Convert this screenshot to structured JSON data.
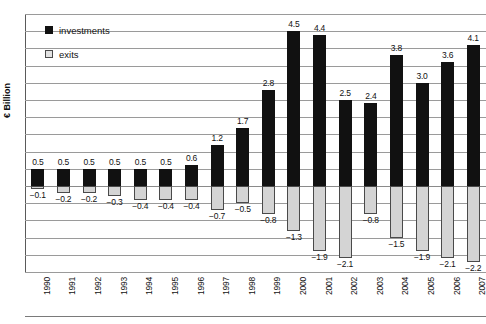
{
  "chart_data": {
    "type": "bar",
    "title": "",
    "xlabel": "",
    "ylabel": "€ Billion",
    "ylim": [
      -2.5,
      5.0
    ],
    "grid": true,
    "legend_position": "top-left-inside",
    "categories": [
      "1990",
      "1991",
      "1992",
      "1993",
      "1994",
      "1995",
      "1996",
      "1997",
      "1998",
      "1999",
      "2000",
      "2001",
      "2002",
      "2003",
      "2004",
      "2005",
      "2006",
      "2007"
    ],
    "series": [
      {
        "name": "investments",
        "color": "#111111",
        "values": [
          0.5,
          0.5,
          0.5,
          0.5,
          0.5,
          0.5,
          0.6,
          1.2,
          1.7,
          2.8,
          4.5,
          4.4,
          2.5,
          2.4,
          3.8,
          3.0,
          3.6,
          4.1
        ],
        "labels": [
          "0.5",
          "0.5",
          "0.5",
          "0.5",
          "0.5",
          "0.5",
          "0.6",
          "1.2",
          "1.7",
          "2.8",
          "4.5",
          "4.4",
          "2.5",
          "2.4",
          "3.8",
          "3.0",
          "3.6",
          "4.1"
        ]
      },
      {
        "name": "exits",
        "color": "#d4d4d4",
        "values": [
          -0.1,
          -0.2,
          -0.2,
          -0.3,
          -0.4,
          -0.4,
          -0.4,
          -0.7,
          -0.5,
          -0.8,
          -1.3,
          -1.9,
          -2.1,
          -0.8,
          -1.5,
          -1.9,
          -2.1,
          -2.2
        ],
        "labels": [
          "−0.1",
          "−0.2",
          "−0.2",
          "−0.3",
          "−0.4",
          "−0.4",
          "−0.4",
          "−0.7",
          "−0.5",
          "−0.8",
          "−1.3",
          "−1.9",
          "−2.1",
          "−0.8",
          "−1.5",
          "−1.9",
          "−2.1",
          "−2.2"
        ]
      }
    ],
    "gridline_values": [
      5.0,
      4.5,
      4.0,
      3.5,
      3.0,
      2.5,
      2.0,
      1.5,
      1.0,
      0.5,
      0.0,
      -0.5,
      -1.0,
      -1.5,
      -2.0,
      -2.5
    ]
  },
  "legend": {
    "items": [
      {
        "label": "investments",
        "swatch": "filled-black-square"
      },
      {
        "label": "exits",
        "swatch": "outlined-gray-square"
      }
    ]
  },
  "axes": {
    "y_title": "€ Billion"
  }
}
